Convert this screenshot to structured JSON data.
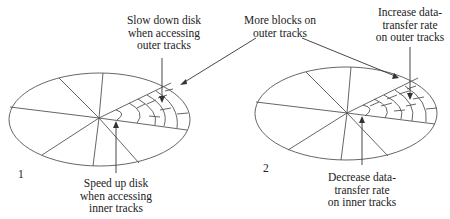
{
  "figure": {
    "disk1": {
      "number": "1",
      "top_label": [
        "Slow down disk",
        "when accessing",
        "outer tracks"
      ],
      "bottom_label": [
        "Speed up disk",
        "when accessing",
        "inner tracks"
      ]
    },
    "disk2": {
      "number": "2",
      "top_label": [
        "Increase data-",
        "transfer rate",
        "on outer tracks"
      ],
      "bottom_label": [
        "Decrease data-",
        "transfer rate",
        "on inner tracks"
      ]
    },
    "shared_label": [
      "More blocks on",
      "outer tracks"
    ]
  }
}
